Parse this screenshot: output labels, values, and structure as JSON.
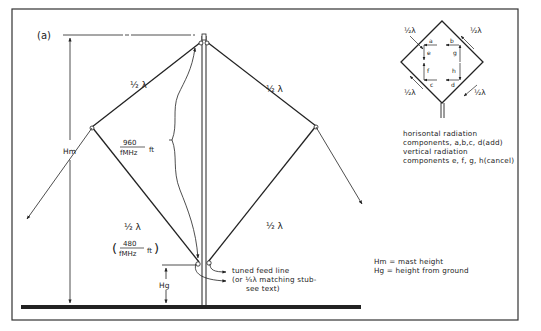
{
  "figure": {
    "panel_label": "(a)",
    "labels": {
      "half_lambda": "½ λ",
      "upper_left_len_num": "960",
      "upper_left_len_den": "fMHz",
      "upper_left_len_unit": "ft",
      "lower_left_len_num": "480",
      "lower_left_len_den": "fMHz",
      "lower_left_len_unit": "ft",
      "hm": "Hm",
      "hg": "Hg"
    },
    "feed_note": {
      "line1": "tuned feed line",
      "line2": "(or ¼λ matching stub-",
      "line3": "see text)"
    },
    "legend": {
      "hm": "Hm = mast height",
      "hg": "Hg = height from ground"
    }
  },
  "inset": {
    "labels": {
      "top_left": "½λ",
      "top_right": "½λ",
      "bottom_left": "½λ",
      "bottom_right": "½λ"
    },
    "components": [
      "a",
      "b",
      "c",
      "d",
      "e",
      "f",
      "g",
      "h"
    ],
    "caption": {
      "line1": "horisontal radiation",
      "line2": "components, a,b,c, d(add)",
      "line3": "vertical radiation",
      "line4": "components e, f, g, h(cancel)"
    }
  }
}
